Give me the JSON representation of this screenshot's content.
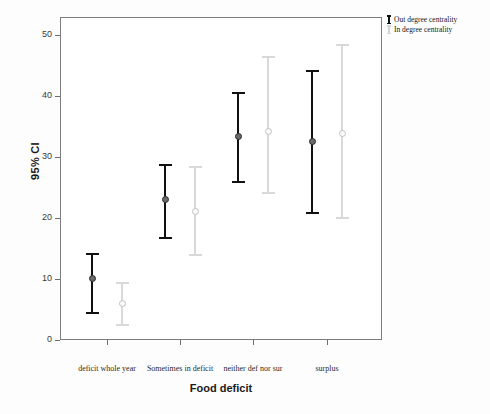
{
  "chart_data": {
    "type": "scatter",
    "title": "",
    "xlabel": "Food deficit",
    "ylabel": "95% CI",
    "ylim": [
      0,
      52
    ],
    "yticks": [
      0,
      10,
      20,
      30,
      40,
      50
    ],
    "grid": false,
    "legend_position": "top-right",
    "categories": [
      "deficit whole year",
      "Sometimes in deficit",
      "neither def nor sur",
      "surplus"
    ],
    "series": [
      {
        "name": "Out degree centrality",
        "color": "#111111",
        "values": [
          10.0,
          23.0,
          33.3,
          32.5
        ],
        "ci_lower": [
          4.3,
          16.5,
          25.8,
          20.7
        ],
        "ci_upper": [
          14.2,
          28.8,
          40.7,
          44.2
        ]
      },
      {
        "name": "In degree centrality",
        "color": "#d9d9d9",
        "values": [
          6.0,
          21.0,
          34.2,
          33.8
        ],
        "ci_lower": [
          2.3,
          13.7,
          24.0,
          19.8
        ],
        "ci_upper": [
          9.5,
          28.5,
          46.5,
          48.5
        ]
      }
    ]
  },
  "axes": {
    "y_title": "95% CI",
    "x_title": "Food deficit",
    "y_tick_labels": [
      "0",
      "10",
      "20",
      "30",
      "40",
      "50"
    ],
    "x_tick_labels": [
      "deficit whole year",
      "Sometimes in deficit",
      "neither def nor sur",
      "surplus"
    ]
  },
  "legend": {
    "items": [
      {
        "label": "Out degree centrality",
        "marker": "errorbar-black"
      },
      {
        "label": "In degree centrality",
        "marker": "errorbar-gray"
      }
    ]
  }
}
